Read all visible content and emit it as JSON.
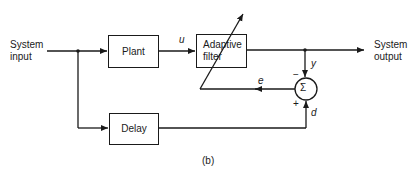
{
  "diagram": {
    "caption": "(b)",
    "inputs": {
      "system_input": "System\ninput"
    },
    "outputs": {
      "system_output": "System\noutput"
    },
    "blocks": {
      "plant": "Plant",
      "adaptive_filter": "Adaptive\nfilter",
      "delay": "Delay",
      "summer": "Σ"
    },
    "signals": {
      "u": "u",
      "y": "y",
      "e": "e",
      "d": "d"
    },
    "signs": {
      "minus": "−",
      "plus": "+"
    }
  }
}
